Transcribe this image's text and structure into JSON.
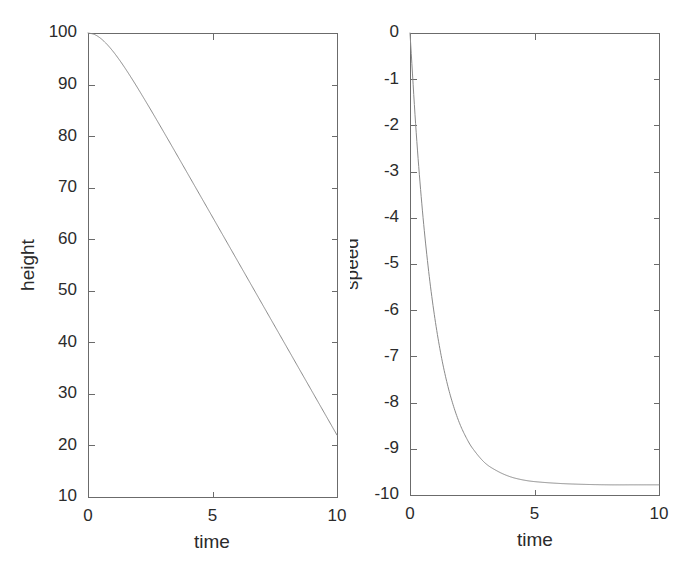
{
  "figure": {
    "width": 694,
    "height": 577,
    "background": "#ffffff",
    "axis_color": "#6b6b6b",
    "curve_color": "#8a8a8a",
    "text_color": "#2b2b2b"
  },
  "chart_data": [
    {
      "id": "height-plot",
      "type": "line",
      "title": "",
      "xlabel": "time",
      "ylabel": "height",
      "xlim": [
        0,
        10
      ],
      "ylim": [
        10,
        100
      ],
      "grid": false,
      "legend": "none",
      "xticks": [
        0,
        5,
        10
      ],
      "xtick_labels": [
        "0",
        "5",
        "10"
      ],
      "yticks": [
        10,
        20,
        30,
        40,
        50,
        60,
        70,
        80,
        90,
        100
      ],
      "ytick_labels": [
        "10",
        "20",
        "30",
        "40",
        "50",
        "60",
        "70",
        "80",
        "90",
        "100"
      ],
      "series": [
        {
          "name": "height",
          "x": [
            0,
            0.25,
            0.5,
            0.75,
            1,
            1.25,
            1.5,
            1.75,
            2,
            2.5,
            3,
            3.5,
            4,
            4.5,
            5,
            5.5,
            6,
            6.5,
            7,
            7.5,
            8,
            8.5,
            9,
            9.5,
            10
          ],
          "y": [
            100,
            99.73,
            98.99,
            97.87,
            96.47,
            94.86,
            93.1,
            91.23,
            89.29,
            85.27,
            81.14,
            76.96,
            72.75,
            68.53,
            64.31,
            60.08,
            55.85,
            51.62,
            47.39,
            43.16,
            38.93,
            34.7,
            30.47,
            26.24,
            22.01
          ]
        }
      ]
    },
    {
      "id": "speed-plot",
      "type": "line",
      "title": "",
      "xlabel": "time",
      "ylabel": "speed",
      "xlim": [
        0,
        10
      ],
      "ylim": [
        -10,
        0
      ],
      "grid": false,
      "legend": "none",
      "xticks": [
        0,
        5,
        10
      ],
      "xtick_labels": [
        "0",
        "5",
        "10"
      ],
      "yticks": [
        -10,
        -9,
        -8,
        -7,
        -6,
        -5,
        -4,
        -3,
        -2,
        -1,
        0
      ],
      "ytick_labels": [
        "-10",
        "-9",
        "-8",
        "-7",
        "-6",
        "-5",
        "-4",
        "-3",
        "-2",
        "-1",
        "0"
      ],
      "series": [
        {
          "name": "speed",
          "x": [
            0,
            0.25,
            0.5,
            0.75,
            1,
            1.25,
            1.5,
            1.75,
            2,
            2.25,
            2.5,
            3,
            3.5,
            4,
            4.5,
            5,
            6,
            7,
            8,
            9,
            10
          ],
          "y": [
            0,
            -2.16,
            -3.85,
            -5.16,
            -6.18,
            -6.98,
            -7.6,
            -8.08,
            -8.46,
            -8.75,
            -8.98,
            -9.3,
            -9.48,
            -9.6,
            -9.67,
            -9.71,
            -9.75,
            -9.77,
            -9.78,
            -9.78,
            -9.78
          ]
        }
      ]
    }
  ]
}
